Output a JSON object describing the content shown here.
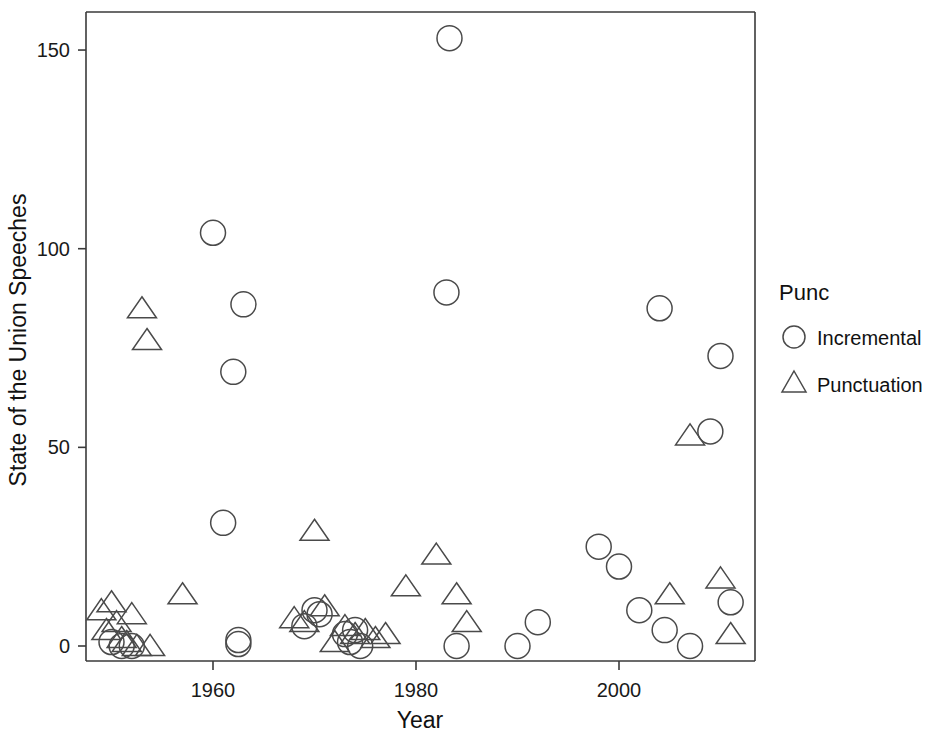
{
  "chart_data": {
    "type": "scatter",
    "title": "",
    "xlabel": "Year",
    "ylabel": "State of the Union Speeches",
    "xlim": [
      1948,
      2012
    ],
    "ylim": [
      -6,
      160
    ],
    "xticks": [
      1960,
      1980,
      2000
    ],
    "xticklabels": [
      "1960",
      "1980",
      "2000"
    ],
    "yticks": [
      0,
      50,
      100,
      150
    ],
    "yticklabels": [
      "0",
      "50",
      "100",
      "150"
    ],
    "grid": false,
    "legend": {
      "title": "Punc",
      "position": "right",
      "entries": [
        {
          "label": "Incremental",
          "marker": "circle"
        },
        {
          "label": "Punctuation",
          "marker": "triangle"
        }
      ]
    },
    "series": [
      {
        "name": "Incremental",
        "marker": "circle",
        "points": [
          [
            1950,
            1
          ],
          [
            1951,
            0
          ],
          [
            1952,
            0
          ],
          [
            1960,
            104
          ],
          [
            1962,
            69
          ],
          [
            1963,
            86
          ],
          [
            1961,
            31
          ],
          [
            1962.5,
            0.5
          ],
          [
            1962.5,
            1.5
          ],
          [
            1969,
            5
          ],
          [
            1970,
            9
          ],
          [
            1970.5,
            8
          ],
          [
            1973,
            3
          ],
          [
            1973.5,
            1
          ],
          [
            1974,
            4
          ],
          [
            1974.5,
            0
          ],
          [
            1983,
            89
          ],
          [
            1983.3,
            153
          ],
          [
            1984,
            0
          ],
          [
            1990,
            0
          ],
          [
            1992,
            6
          ],
          [
            1998,
            25
          ],
          [
            2000,
            20
          ],
          [
            2002,
            9
          ],
          [
            2004,
            85
          ],
          [
            2004.5,
            4
          ],
          [
            2007,
            0
          ],
          [
            2009,
            54
          ],
          [
            2010,
            73
          ],
          [
            2011,
            11
          ]
        ]
      },
      {
        "name": "Punctuation",
        "marker": "triangle",
        "points": [
          [
            1949,
            9
          ],
          [
            1949.5,
            4
          ],
          [
            1950,
            11
          ],
          [
            1950.5,
            6
          ],
          [
            1951,
            2
          ],
          [
            1951.5,
            1
          ],
          [
            1952,
            8
          ],
          [
            1952.5,
            0
          ],
          [
            1953,
            85
          ],
          [
            1953.5,
            77
          ],
          [
            1953.8,
            0
          ],
          [
            1957,
            13
          ],
          [
            1968,
            7
          ],
          [
            1969,
            6
          ],
          [
            1970,
            29
          ],
          [
            1971,
            10
          ],
          [
            1972,
            1
          ],
          [
            1973,
            5
          ],
          [
            1974,
            3
          ],
          [
            1975,
            4
          ],
          [
            1976,
            2
          ],
          [
            1977,
            3
          ],
          [
            1979,
            15
          ],
          [
            1982,
            23
          ],
          [
            1984,
            13
          ],
          [
            1985,
            6
          ],
          [
            2005,
            13
          ],
          [
            2007,
            53
          ],
          [
            2010,
            17
          ],
          [
            2011,
            3
          ]
        ]
      }
    ]
  },
  "geometry": {
    "plot_left": 86,
    "plot_right": 755,
    "plot_top": 12,
    "plot_bottom": 661,
    "x_pixels_per_year": 10.15,
    "y_zero_pixel": 646,
    "y_pixels_per_unit": 3.973
  }
}
